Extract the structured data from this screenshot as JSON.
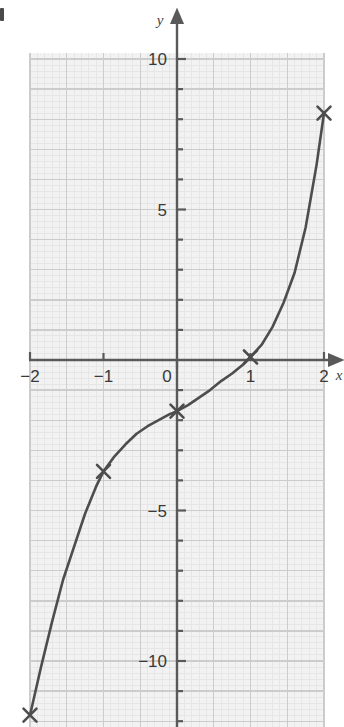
{
  "figure": {
    "kind": "coordinate-grid-plot",
    "background_color": "#ffffff",
    "grid_fill_color": "#f2f2f2",
    "major_grid_color": "#c8c8c8",
    "minor_grid_color": "#e2e2e2",
    "axis_color": "#595959",
    "curve_color": "#4d4d4d",
    "marker_color": "#4d4d4d"
  },
  "labels": {
    "y_axis": "y",
    "x_axis": "x"
  },
  "ticks": {
    "x": [
      "−2",
      "−1",
      "0",
      "1",
      "2"
    ],
    "y": [
      "10",
      "5",
      "−5",
      "−10"
    ]
  },
  "chart_data": {
    "type": "line",
    "title": "",
    "xlabel": "x",
    "ylabel": "y",
    "xlim": [
      -2.0,
      2.0
    ],
    "ylim": [
      -12.0,
      10.0
    ],
    "grid": true,
    "legend": "none",
    "x_major_step": 0.5,
    "x_tick_label_step": 1,
    "y_major_step": 1,
    "y_tick_label_step": 5,
    "x_tick_values": [
      -2,
      -1,
      0,
      1,
      2
    ],
    "y_tick_values": [
      10,
      5,
      -5,
      -10
    ],
    "series": [
      {
        "name": "cubic curve",
        "marker": "x",
        "x": [
          -2,
          -1,
          0,
          1,
          2
        ],
        "values": [
          -11.8,
          -3.7,
          -1.7,
          0.1,
          8.2
        ]
      }
    ],
    "curve_points": [
      [
        -2.0,
        -11.8
      ],
      [
        -1.85,
        -10.2
      ],
      [
        -1.7,
        -8.7
      ],
      [
        -1.55,
        -7.3
      ],
      [
        -1.4,
        -6.2
      ],
      [
        -1.25,
        -5.1
      ],
      [
        -1.1,
        -4.2
      ],
      [
        -1.0,
        -3.7
      ],
      [
        -0.85,
        -3.2
      ],
      [
        -0.7,
        -2.8
      ],
      [
        -0.55,
        -2.45
      ],
      [
        -0.4,
        -2.2
      ],
      [
        -0.25,
        -2.0
      ],
      [
        -0.1,
        -1.8
      ],
      [
        0.0,
        -1.7
      ],
      [
        0.15,
        -1.5
      ],
      [
        0.3,
        -1.25
      ],
      [
        0.45,
        -1.0
      ],
      [
        0.6,
        -0.7
      ],
      [
        0.75,
        -0.45
      ],
      [
        0.9,
        -0.15
      ],
      [
        1.0,
        0.1
      ],
      [
        1.15,
        0.5
      ],
      [
        1.3,
        1.1
      ],
      [
        1.45,
        1.9
      ],
      [
        1.6,
        2.9
      ],
      [
        1.75,
        4.4
      ],
      [
        1.9,
        6.5
      ],
      [
        2.0,
        8.2
      ]
    ],
    "annotations": []
  }
}
